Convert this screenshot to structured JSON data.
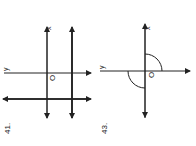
{
  "problems": [
    {
      "number": "41.",
      "axis_labels": {
        "x": "x",
        "y": "y",
        "origin": "O"
      },
      "description": "Two vertical lines (x-axis and a parallel bold line) crossed by two horizontal lines (y-axis and a parallel bold line)"
    },
    {
      "number": "43.",
      "axis_labels": {
        "x": "x",
        "y": "y",
        "origin": "O"
      },
      "description": "Axes with two quarter-circle arcs in opposite quadrants"
    }
  ],
  "colors": {
    "ink": "#222222",
    "paper": "#ffffff"
  }
}
